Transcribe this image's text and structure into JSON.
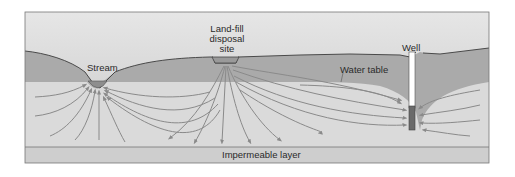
{
  "figure": {
    "type": "groundwater-flow-cross-section",
    "labels": {
      "stream": "Stream",
      "landfill_line1": "Land-fill",
      "landfill_line2": "disposal",
      "landfill_line3": "site",
      "well": "Well",
      "water_table": "Water table",
      "impermeable_layer": "Impermeable layer"
    },
    "colors": {
      "sky_top": "#e4e4e4",
      "sky_bottom": "#c9c9c9",
      "unsaturated_zone": "#a9a9a9",
      "saturated_zone": "#d9d9d9",
      "impermeable_layer": "#cfcfcf",
      "stream_water": "#8e8e8e",
      "flow_arrow": "#8a8a8a",
      "well_casing": "#ffffff",
      "well_screen": "#666666",
      "outline": "#555555"
    }
  }
}
